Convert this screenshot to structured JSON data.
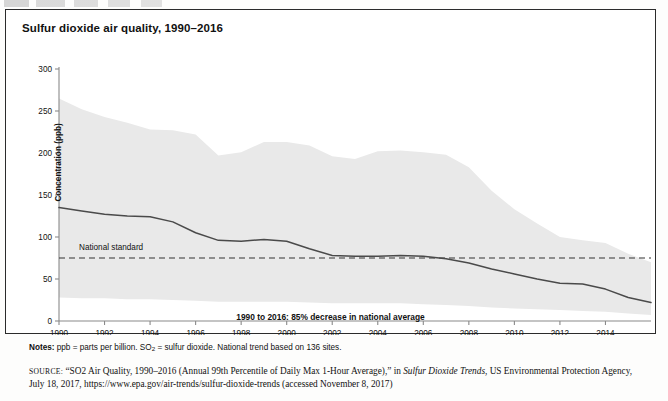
{
  "figure": {
    "title": "Sulfur dioxide air quality, 1990–2016",
    "top_remnant": ""
  },
  "notes": {
    "prefix": "Notes:",
    "text_a": " ppb = parts per billion. SO",
    "sub": "2",
    "text_b": " = sulfur dioxide. National trend based on 136 sites."
  },
  "source": {
    "label": "SOURCE:",
    "part1": " “SO2 Air Quality, 1990–2016 (Annual 99th Percentile of Daily Max 1-Hour Average),” in ",
    "italic": "Sulfur Dioxide Trends",
    "part2": ", US Environmental Protection Agency, July 18, 2017, https://www.epa.gov/air-trends/sulfur-dioxide-trends (accessed November 8, 2017)"
  },
  "colors": {
    "band": "#e9e9e9",
    "line": "#4a4a4a",
    "axis": "#8a8a8a",
    "standard": "#333333",
    "text": "#111111",
    "border": "#2b2b2b"
  },
  "chart_data": {
    "type": "line",
    "title": "Sulfur dioxide air quality, 1990–2016",
    "subtitle": "1990 to 2016: 85% decrease in national average",
    "xlabel": "",
    "ylabel": "Concentration (ppb)",
    "ylim": [
      0,
      300
    ],
    "yticks": [
      0,
      50,
      100,
      150,
      200,
      250,
      300
    ],
    "xlim": [
      1990,
      2016
    ],
    "xticks": [
      1990,
      1992,
      1994,
      1996,
      1998,
      2000,
      2002,
      2004,
      2006,
      2008,
      2010,
      2012,
      2014
    ],
    "xtick_labels": [
      "1990",
      "1992",
      "1994",
      "1996",
      "1998",
      "2000",
      "2002",
      "2004",
      "2006",
      "2008",
      "2010",
      "2012",
      "2014"
    ],
    "grid": false,
    "legend_position": "none",
    "x": [
      1990,
      1991,
      1992,
      1993,
      1994,
      1995,
      1996,
      1997,
      1998,
      1999,
      2000,
      2001,
      2002,
      2003,
      2004,
      2005,
      2006,
      2007,
      2008,
      2009,
      2010,
      2011,
      2012,
      2013,
      2014,
      2015,
      2016
    ],
    "series": [
      {
        "name": "90th percentile (upper bound)",
        "type": "band_upper",
        "values": [
          265,
          252,
          243,
          236,
          228,
          227,
          222,
          197,
          201,
          213,
          213,
          209,
          196,
          193,
          202,
          203,
          201,
          198,
          183,
          155,
          133,
          116,
          100,
          96,
          93,
          80,
          70
        ]
      },
      {
        "name": "National average (99th percentile of daily max 1-hour)",
        "type": "line",
        "values": [
          135,
          131,
          127,
          125,
          124,
          118,
          105,
          96,
          95,
          97,
          95,
          86,
          78,
          77,
          77,
          78,
          77,
          74,
          69,
          62,
          56,
          50,
          45,
          44,
          38,
          28,
          22
        ]
      },
      {
        "name": "10th percentile (lower bound)",
        "type": "band_lower",
        "values": [
          28,
          27,
          27,
          26,
          26,
          25,
          24,
          23,
          23,
          23,
          23,
          22,
          21,
          21,
          21,
          21,
          20,
          19,
          18,
          16,
          15,
          14,
          13,
          12,
          11,
          9,
          7
        ]
      }
    ],
    "annotations": [
      {
        "name": "National standard",
        "label": "National standard",
        "type": "hline",
        "y": 75,
        "style": "dashed"
      }
    ]
  }
}
